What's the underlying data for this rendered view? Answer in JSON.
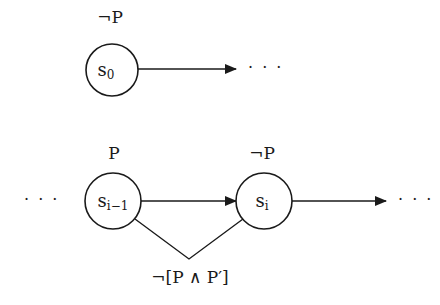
{
  "diagram": {
    "type": "state-sequence",
    "colors": {
      "stroke": "#1a1a1a",
      "background": "#ffffff"
    },
    "top_row": {
      "node": {
        "id": "s0",
        "label_base": "s",
        "label_sub": "0",
        "annotation": "¬P"
      },
      "trailing_ellipsis": "· · ·"
    },
    "bottom_row": {
      "leading_ellipsis": "· · ·",
      "nodes": [
        {
          "id": "s_i-1",
          "label_base": "s",
          "label_sub": "i−1",
          "annotation": "P"
        },
        {
          "id": "s_i",
          "label_base": "s",
          "label_sub": "i",
          "annotation": "¬P"
        }
      ],
      "trailing_ellipsis": "· · ·",
      "constraint_label": "¬[P ∧ P′]"
    }
  }
}
